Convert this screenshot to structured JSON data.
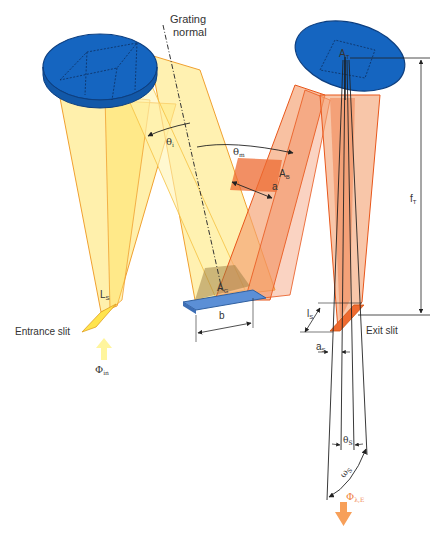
{
  "figure": {
    "colors": {
      "mirror": "#1565C0",
      "mirror_edge": "#0D3F80",
      "entrance_beam": "#FFEB90",
      "entrance_edge": "#F0A030",
      "exit_beam": "#F4A070",
      "exit_edge": "#E8561A",
      "grating": "#5B8FD6",
      "flux_in": "#FFF59D",
      "flux_out": "#F7A05A"
    }
  },
  "labels": {
    "grating_normal_line1": "Grating",
    "grating_normal_line2": "normal",
    "theta_i": "θ",
    "theta_i_sub": "i",
    "theta_m": "θ",
    "theta_m_sub": "m",
    "A_T": "A",
    "A_T_sub": "T",
    "A_B": "A",
    "A_B_sub": "B",
    "a": "a",
    "A_G": "A",
    "A_G_sub": "G",
    "b": "b",
    "L_S": "L",
    "L_S_sub": "S",
    "entrance_slit": "Entrance slit",
    "phi_in": "Φ",
    "phi_in_sub": "in",
    "f_T": "f",
    "f_T_sub": "T",
    "l_S": "l",
    "l_S_sub": "S",
    "exit_slit": "Exit slit",
    "a_S": "a",
    "a_S_sub": "S",
    "theta_S": "θ",
    "theta_S_sub": "S",
    "omega_S": "ω",
    "omega_S_sub": "S",
    "phi_out": "Φ",
    "phi_out_sub": "λ,E"
  }
}
